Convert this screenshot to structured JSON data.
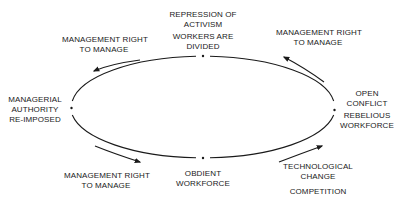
{
  "diagram": {
    "type": "cycle",
    "nodes": {
      "top": {
        "lines": [
          "REPRESSION OF",
          "ACTIVISM"
        ],
        "lines2": [
          "WORKERS ARE",
          "DIVIDED"
        ]
      },
      "right": {
        "lines": [
          "OPEN",
          "CONFLICT"
        ],
        "lines2": [
          "REBELIOUS",
          "WORKFORCE"
        ]
      },
      "bottom": {
        "lines": [
          "OBDIENT",
          "WORKFORCE"
        ]
      },
      "left": {
        "lines": [
          "MANAGERIAL",
          "AUTHORITY",
          "RE-IMPOSED"
        ]
      }
    },
    "arrows": {
      "top_left": {
        "lines": [
          "MANAGEMENT RIGHT",
          "TO MANAGE"
        ]
      },
      "top_right": {
        "lines": [
          "MANAGEMENT RIGHT",
          "TO MANAGE"
        ]
      },
      "bottom_left": {
        "lines": [
          "MANAGEMENT RIGHT",
          "TO MANAGE"
        ]
      },
      "bottom_right": {
        "lines": [
          "TECHNOLOGICAL",
          "CHANGE"
        ],
        "lines2": [
          "COMPETITION"
        ]
      }
    },
    "colors": {
      "line": "#1a1a1a",
      "background": "#ffffff"
    }
  }
}
